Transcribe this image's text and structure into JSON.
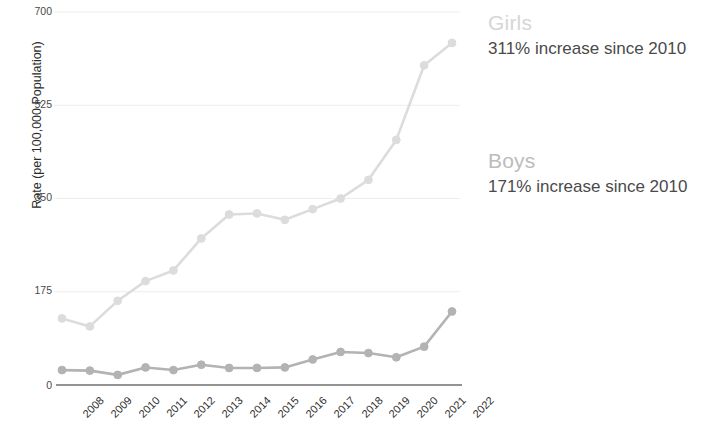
{
  "chart_data": {
    "type": "line",
    "title": "",
    "subtitle": "",
    "xlabel": "",
    "ylabel": "Rate (per 100,000 Population)",
    "x": [
      2008,
      2009,
      2010,
      2011,
      2012,
      2013,
      2014,
      2015,
      2016,
      2017,
      2018,
      2019,
      2020,
      2021,
      2022
    ],
    "categories": [
      "2008",
      "2009",
      "2010",
      "2011",
      "2012",
      "2013",
      "2014",
      "2015",
      "2016",
      "2017",
      "2018",
      "2019",
      "2020",
      "2021",
      "2022"
    ],
    "ylim": [
      0,
      700
    ],
    "yticks": [
      0,
      175,
      350,
      525,
      700
    ],
    "ytick_labels": [
      "0",
      "175",
      "350",
      "525",
      "700"
    ],
    "grid": true,
    "legend_position": "right",
    "markers": "circle",
    "series": [
      {
        "name": "Girls",
        "color": "#dcdcdc",
        "annotation": "311% increase since 2010",
        "values": [
          125,
          110,
          158,
          195,
          215,
          275,
          320,
          322,
          310,
          330,
          350,
          385,
          460,
          600,
          642
        ]
      },
      {
        "name": "Boys",
        "color": "#b3b3b3",
        "annotation": "171% increase since 2010",
        "values": [
          28,
          27,
          19,
          33,
          28,
          38,
          32,
          32,
          33,
          48,
          62,
          60,
          52,
          72,
          138
        ]
      }
    ]
  },
  "legend": {
    "girls": {
      "label": "Girls",
      "sublabel": "311% increase since 2010",
      "color": "#d6d6d6"
    },
    "boys": {
      "label": "Boys",
      "sublabel": "171% increase since 2010",
      "color": "#bcbcbc"
    }
  },
  "axis": {
    "y_title": "Rate (per 100,000 Population)",
    "y_labels": [
      "700",
      "525",
      "350",
      "175",
      "0"
    ],
    "x_labels": [
      "2008",
      "2009",
      "2010",
      "2011",
      "2012",
      "2013",
      "2014",
      "2015",
      "2016",
      "2017",
      "2018",
      "2019",
      "2020",
      "2021",
      "2022"
    ]
  }
}
